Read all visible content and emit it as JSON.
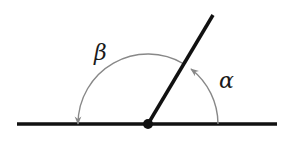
{
  "diagram": {
    "type": "supplementary-angles",
    "labels": {
      "alpha": "α",
      "beta": "β"
    },
    "colors": {
      "lines": "#111111",
      "arcs": "#888888",
      "background": "#ffffff"
    }
  }
}
